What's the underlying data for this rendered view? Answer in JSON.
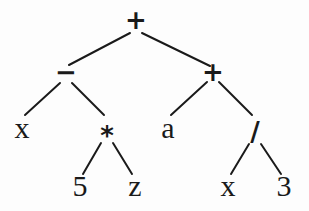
{
  "diagram": {
    "type": "expression-tree",
    "expression": "(x - 5 * z) + (a + x / 3)",
    "nodes": [
      {
        "id": "n0",
        "label": "+",
        "kind": "operator",
        "parent": null
      },
      {
        "id": "n1",
        "label": "−",
        "kind": "operator",
        "parent": "n0"
      },
      {
        "id": "n2",
        "label": "+",
        "kind": "operator",
        "parent": "n0"
      },
      {
        "id": "n3",
        "label": "x",
        "kind": "operand",
        "parent": "n1"
      },
      {
        "id": "n4",
        "label": "*",
        "kind": "operator",
        "parent": "n1"
      },
      {
        "id": "n5",
        "label": "a",
        "kind": "operand",
        "parent": "n2"
      },
      {
        "id": "n6",
        "label": "/",
        "kind": "operator",
        "parent": "n2"
      },
      {
        "id": "n7",
        "label": "5",
        "kind": "operand",
        "parent": "n4"
      },
      {
        "id": "n8",
        "label": "z",
        "kind": "operand",
        "parent": "n4"
      },
      {
        "id": "n9",
        "label": "x",
        "kind": "operand",
        "parent": "n6"
      },
      {
        "id": "n10",
        "label": "3",
        "kind": "operand",
        "parent": "n6"
      }
    ]
  }
}
